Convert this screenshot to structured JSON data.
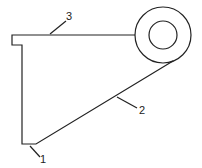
{
  "diagram": {
    "type": "bracket-drawing",
    "labels": [
      {
        "id": "1",
        "text": "1"
      },
      {
        "id": "2",
        "text": "2"
      },
      {
        "id": "3",
        "text": "3"
      }
    ],
    "stroke_color": "#222222"
  }
}
